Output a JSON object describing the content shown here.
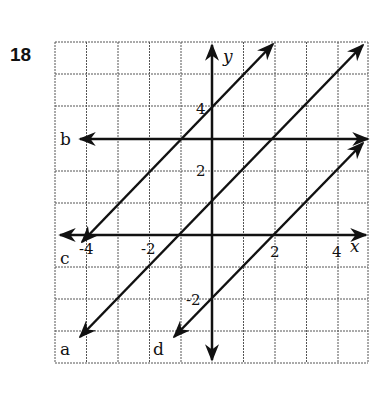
{
  "problem_number": "18",
  "graph": {
    "x_axis_label": "x",
    "y_axis_label": "y",
    "x_ticks": [
      {
        "value": -4,
        "label": "-4"
      },
      {
        "value": -2,
        "label": "-2"
      },
      {
        "value": 2,
        "label": "2"
      },
      {
        "value": 4,
        "label": "4"
      }
    ],
    "y_ticks": [
      {
        "value": 4,
        "label": "4"
      },
      {
        "value": 2,
        "label": "2"
      },
      {
        "value": -2,
        "label": "-2"
      }
    ],
    "x_range": [
      -5,
      5
    ],
    "y_range": [
      -4,
      6
    ],
    "lines": [
      {
        "label": "a",
        "equation": "y = x + 1"
      },
      {
        "label": "b",
        "equation": "y = 3"
      },
      {
        "label": "c",
        "equation": "y = x + 4"
      },
      {
        "label": "d",
        "equation": "y = x - 2"
      }
    ]
  }
}
